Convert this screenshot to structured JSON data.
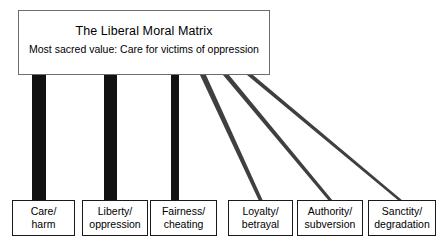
{
  "diagram": {
    "title": "The Liberal Moral Matrix",
    "subtitle": "Most sacred value: Care for victims of oppression",
    "colors": {
      "bar_strong": "#111111",
      "line_thin": "#4a4a4a",
      "box_border": "#1a1a1a",
      "title_border": "#6c6c6c",
      "background": "#ffffff"
    }
  },
  "foundations": [
    {
      "name": "care-harm",
      "line1": "Care/",
      "line2": "harm",
      "emphasis": "strong",
      "connector": "thick-bar"
    },
    {
      "name": "liberty-oppression",
      "line1": "Liberty/",
      "line2": "oppression",
      "emphasis": "strong",
      "connector": "thick-bar"
    },
    {
      "name": "fairness-cheating",
      "line1": "Fairness/",
      "line2": "cheating",
      "emphasis": "medium",
      "connector": "medium-bar"
    },
    {
      "name": "loyalty-betrayal",
      "line1": "Loyalty/",
      "line2": "betrayal",
      "emphasis": "weak",
      "connector": "thin-line"
    },
    {
      "name": "authority-subversion",
      "line1": "Authority/",
      "line2": "subversion",
      "emphasis": "weak",
      "connector": "thin-line"
    },
    {
      "name": "sanctity-degradation",
      "line1": "Sanctity/",
      "line2": "degradation",
      "emphasis": "weak",
      "connector": "thin-line"
    }
  ]
}
